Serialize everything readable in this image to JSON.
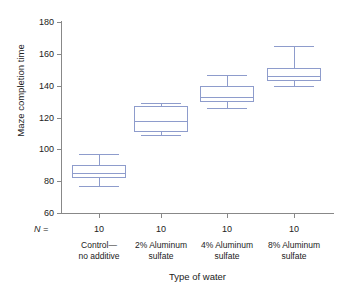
{
  "chart_data": {
    "type": "box",
    "title": "",
    "xlabel": "Type of water",
    "ylabel": "Maze completion time",
    "ylim": [
      60,
      180
    ],
    "yticks": [
      60,
      80,
      100,
      120,
      140,
      160,
      180
    ],
    "grid": false,
    "legend": null,
    "n_label": "N =",
    "box_color": "#8e9ccc",
    "axis_color": "#888888",
    "categories": [
      {
        "line1": "Control—",
        "line2": "no additive",
        "n": "10"
      },
      {
        "line1": "2% Aluminum",
        "line2": "sulfate",
        "n": "10"
      },
      {
        "line1": "4% Aluminum",
        "line2": "sulfate",
        "n": "10"
      },
      {
        "line1": "8% Aluminum",
        "line2": "sulfate",
        "n": "10"
      }
    ],
    "boxes": [
      {
        "category": "Control—no additive",
        "whisker_low": 77,
        "q1": 82,
        "median": 85,
        "q3": 90,
        "whisker_high": 97
      },
      {
        "category": "2% Aluminum sulfate",
        "whisker_low": 109,
        "q1": 111,
        "median": 118,
        "q3": 127,
        "whisker_high": 129
      },
      {
        "category": "4% Aluminum sulfate",
        "whisker_low": 126,
        "q1": 130,
        "median": 133,
        "q3": 140,
        "whisker_high": 147
      },
      {
        "category": "8% Aluminum sulfate",
        "whisker_low": 140,
        "q1": 143,
        "median": 146,
        "q3": 151,
        "whisker_high": 165
      }
    ]
  }
}
